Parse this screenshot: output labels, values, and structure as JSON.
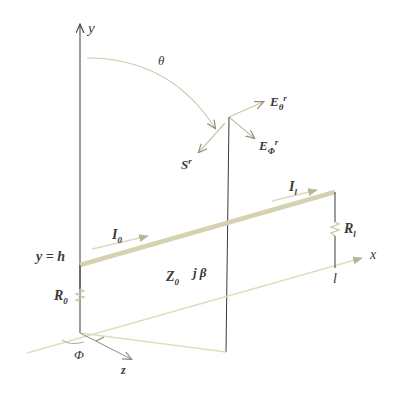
{
  "diagram": {
    "colors": {
      "ink": "#3a3a3a",
      "beige": "#d8d6b4",
      "beige_light": "#e6e4c8",
      "background": "#ffffff"
    },
    "axes": {
      "y": {
        "label": "y"
      },
      "x": {
        "label": "x"
      },
      "z": {
        "label": "z"
      }
    },
    "angles": {
      "theta": "θ",
      "phi": "Φ"
    },
    "labels": {
      "y_eq_h": "y = h",
      "I0": {
        "main": "I",
        "sub": "0"
      },
      "Il": {
        "main": "I",
        "sub": "l"
      },
      "R0": {
        "main": "R",
        "sub": "0"
      },
      "Rl": {
        "main": "R",
        "sub": "l"
      },
      "Z0": {
        "main": "Z",
        "sub": "0"
      },
      "jbeta": "j β",
      "l": "l",
      "E_theta": {
        "main": "E",
        "sub": "θ",
        "sup": "r"
      },
      "E_phi": {
        "main": "E",
        "sub": "Φ",
        "sup": "r"
      },
      "S": {
        "main": "S",
        "sup": "r"
      }
    }
  }
}
